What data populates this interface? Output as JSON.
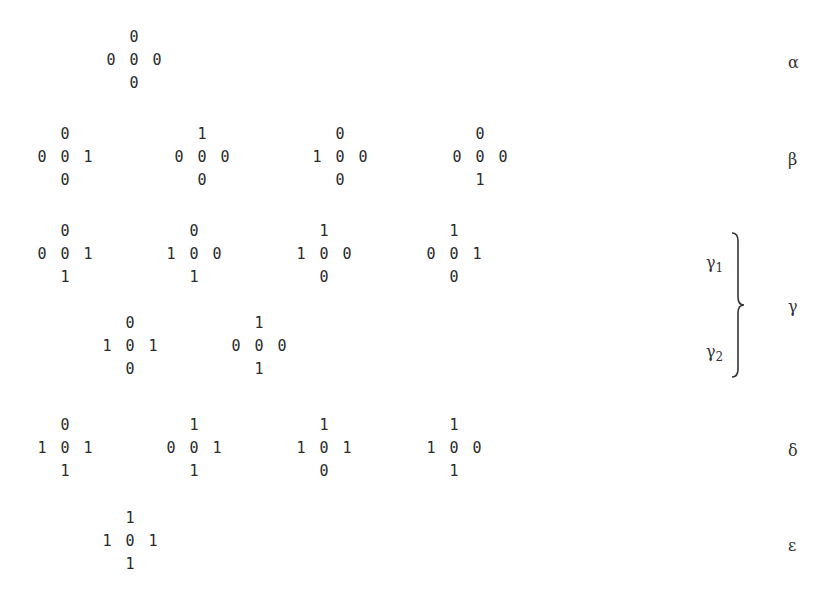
{
  "rows": [
    {
      "label": "α",
      "patterns": [
        {
          "top": "0",
          "left": "0",
          "center": "0",
          "right": "0",
          "bottom": "0"
        }
      ]
    },
    {
      "label": "β",
      "patterns": [
        {
          "top": "0",
          "left": "0",
          "center": "0",
          "right": "1",
          "bottom": "0"
        },
        {
          "top": "1",
          "left": "0",
          "center": "0",
          "right": "0",
          "bottom": "0"
        },
        {
          "top": "0",
          "left": "1",
          "center": "0",
          "right": "0",
          "bottom": "0"
        },
        {
          "top": "0",
          "left": "0",
          "center": "0",
          "right": "0",
          "bottom": "1"
        }
      ]
    },
    {
      "label": "γ",
      "sublabels": [
        "γ1",
        "γ2"
      ],
      "subgroups": [
        {
          "name": "γ",
          "index": "1",
          "patterns": [
            {
              "top": "0",
              "left": "0",
              "center": "0",
              "right": "1",
              "bottom": "1"
            },
            {
              "top": "0",
              "left": "1",
              "center": "0",
              "right": "0",
              "bottom": "1"
            },
            {
              "top": "1",
              "left": "1",
              "center": "0",
              "right": "0",
              "bottom": "0"
            },
            {
              "top": "1",
              "left": "0",
              "center": "0",
              "right": "1",
              "bottom": "0"
            }
          ]
        },
        {
          "name": "γ",
          "index": "2",
          "patterns": [
            {
              "top": "0",
              "left": "1",
              "center": "0",
              "right": "1",
              "bottom": "0"
            },
            {
              "top": "1",
              "left": "0",
              "center": "0",
              "right": "0",
              "bottom": "1"
            }
          ]
        }
      ]
    },
    {
      "label": "δ",
      "patterns": [
        {
          "top": "0",
          "left": "1",
          "center": "0",
          "right": "1",
          "bottom": "1"
        },
        {
          "top": "1",
          "left": "0",
          "center": "0",
          "right": "1",
          "bottom": "1"
        },
        {
          "top": "1",
          "left": "1",
          "center": "0",
          "right": "1",
          "bottom": "0"
        },
        {
          "top": "1",
          "left": "1",
          "center": "0",
          "right": "0",
          "bottom": "1"
        }
      ]
    },
    {
      "label": "ε",
      "patterns": [
        {
          "top": "1",
          "left": "1",
          "center": "0",
          "right": "1",
          "bottom": "1"
        }
      ]
    }
  ]
}
